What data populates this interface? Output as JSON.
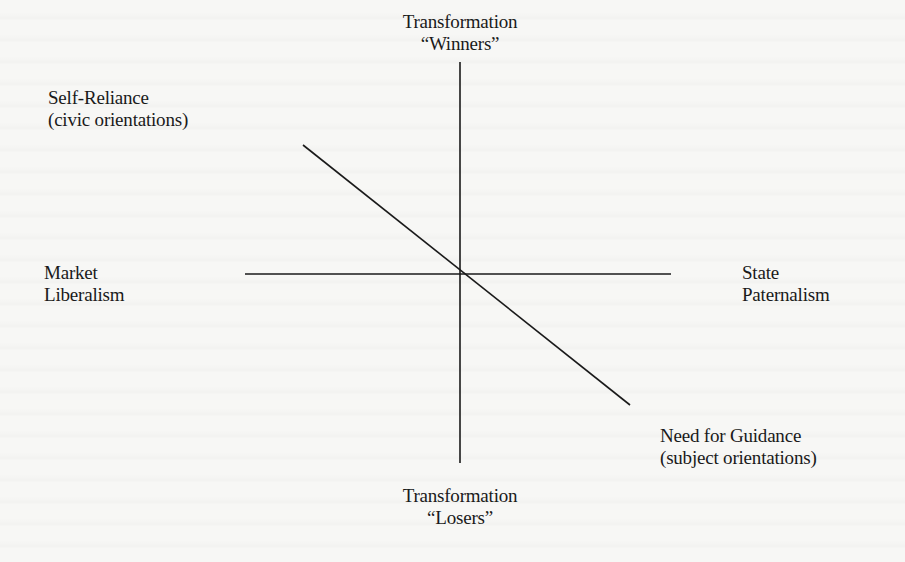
{
  "diagram": {
    "type": "quadrant-axes",
    "top_label": {
      "line1": "Transformation",
      "line2": "“Winners”"
    },
    "bottom_label": {
      "line1": "Transformation",
      "line2": "“Losers”"
    },
    "left_label": {
      "line1": "Market",
      "line2": "Liberalism"
    },
    "right_label": {
      "line1": "State",
      "line2": "Paternalism"
    },
    "upper_left_label": {
      "line1": "Self-Reliance",
      "line2": "(civic orientations)"
    },
    "lower_right_label": {
      "line1": "Need for Guidance",
      "line2": "(subject orientations)"
    },
    "lines": {
      "vertical_axis": {
        "x1": 460,
        "y1": 62,
        "x2": 460,
        "y2": 463
      },
      "horizontal_axis": {
        "x1": 245,
        "y1": 274,
        "x2": 671,
        "y2": 274
      },
      "diagonal": {
        "x1": 303,
        "y1": 145,
        "x2": 630,
        "y2": 405
      }
    },
    "colors": {
      "ink": "#1a1a1a",
      "paper": "#f7f7f5"
    }
  }
}
